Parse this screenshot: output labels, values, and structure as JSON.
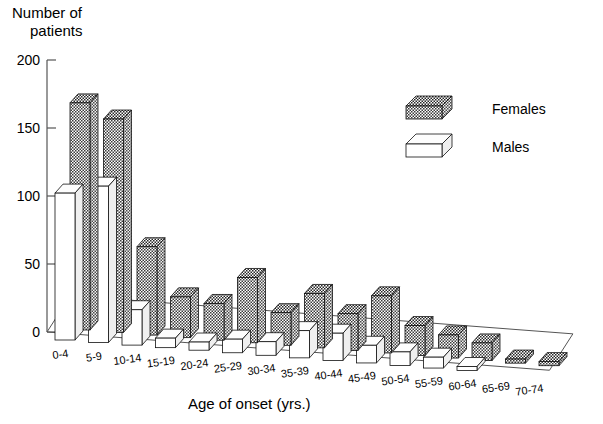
{
  "chart_data": {
    "type": "bar",
    "title": "",
    "ylabel": "Number of patients",
    "xlabel": "Age of onset (yrs.)",
    "ylim": [
      0,
      200
    ],
    "yticks": [
      0,
      50,
      100,
      150,
      200
    ],
    "ytick_labels": [
      "0",
      "50",
      "100",
      "150",
      "200"
    ],
    "grid": false,
    "legend_position": "top-right",
    "projection": "3d",
    "categories": [
      "0-4",
      "5-9",
      "10-14",
      "15-19",
      "20-24",
      "25-29",
      "30-34",
      "35-39",
      "40-44",
      "45-49",
      "50-54",
      "55-59",
      "60-64",
      "65-69",
      "70-74"
    ],
    "series": [
      {
        "name": "Females",
        "color": "#585858",
        "pattern": "checkered",
        "values": [
          167,
          157,
          65,
          30,
          27,
          48,
          24,
          40,
          27,
          42,
          22,
          17,
          13,
          3,
          3
        ]
      },
      {
        "name": "Males",
        "color": "#ffffff",
        "pattern": "solid-white",
        "values": [
          108,
          115,
          26,
          7,
          6,
          10,
          10,
          20,
          20,
          13,
          10,
          8,
          3,
          0,
          0
        ]
      }
    ]
  },
  "labels": {
    "ylabel_line1": "Number of",
    "ylabel_line2": "patients",
    "xlabel": "Age of onset (yrs.)",
    "legend": {
      "females": "Females",
      "males": "Males"
    }
  }
}
